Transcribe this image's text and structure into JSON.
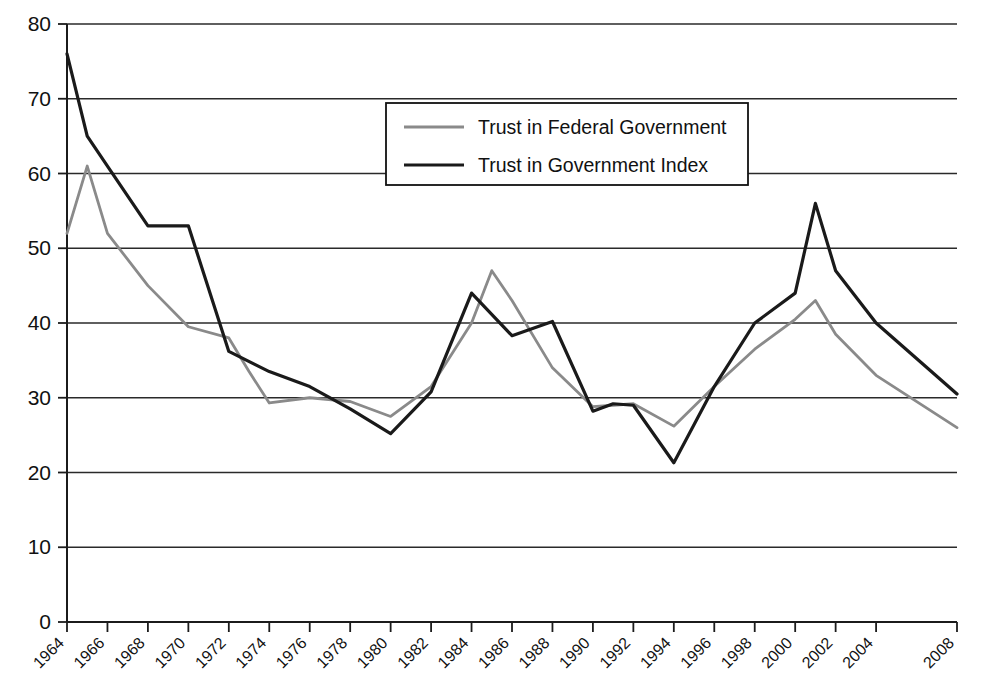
{
  "chart_data": {
    "type": "line",
    "title": "",
    "xlabel": "",
    "ylabel": "",
    "xlim": [
      1964,
      2008
    ],
    "ylim": [
      0,
      80
    ],
    "grid": true,
    "grid_axis": "y",
    "legend_position": "top-center",
    "ytick_labels": [
      "0",
      "10",
      "20",
      "30",
      "40",
      "50",
      "60",
      "70",
      "80"
    ],
    "ytick_values": [
      0,
      10,
      20,
      30,
      40,
      50,
      60,
      70,
      80
    ],
    "xtick_labels": [
      "1964",
      "1966",
      "1968",
      "1970",
      "1972",
      "1974",
      "1976",
      "1978",
      "1980",
      "1982",
      "1984",
      "1986",
      "1988",
      "1990",
      "1992",
      "1994",
      "1996",
      "1998",
      "2000",
      "2002",
      "2004",
      "2008"
    ],
    "xtick_values": [
      1964,
      1966,
      1968,
      1970,
      1972,
      1974,
      1976,
      1978,
      1980,
      1982,
      1984,
      1986,
      1988,
      1990,
      1992,
      1994,
      1996,
      1998,
      2000,
      2002,
      2004,
      2008
    ],
    "series": [
      {
        "name": "Trust in Federal Government",
        "color": "#8a8a8a",
        "x": [
          1964,
          1965,
          1966,
          1968,
          1970,
          1972,
          1973,
          1974,
          1976,
          1978,
          1980,
          1982,
          1984,
          1985,
          1986,
          1988,
          1990,
          1991,
          1992,
          1994,
          1996,
          1998,
          2000,
          2001,
          2002,
          2004,
          2008
        ],
        "values": [
          52,
          61,
          52,
          45,
          39.5,
          38,
          33.5,
          29.3,
          30,
          29.5,
          27.5,
          31.5,
          40,
          47,
          43,
          34,
          28.8,
          29,
          29.2,
          26.2,
          31.5,
          36.5,
          40.5,
          43,
          38.5,
          33,
          26
        ]
      },
      {
        "name": "Trust in Government Index",
        "color": "#1a1a1a",
        "x": [
          1964,
          1965,
          1966,
          1968,
          1970,
          1972,
          1974,
          1976,
          1978,
          1980,
          1982,
          1984,
          1986,
          1988,
          1990,
          1991,
          1992,
          1994,
          1996,
          1998,
          2000,
          2001,
          2002,
          2004,
          2008
        ],
        "values": [
          76,
          65,
          61,
          53,
          53,
          36.2,
          33.5,
          31.5,
          28.5,
          25.2,
          30.8,
          44,
          38.3,
          40.2,
          28.2,
          29.2,
          29,
          21.3,
          31.5,
          40,
          44,
          56,
          47,
          40,
          30.5
        ]
      }
    ]
  },
  "legend": {
    "entries": [
      {
        "label": "Trust in Federal Government",
        "color": "#8a8a8a"
      },
      {
        "label": "Trust in Government Index",
        "color": "#1a1a1a"
      }
    ]
  }
}
